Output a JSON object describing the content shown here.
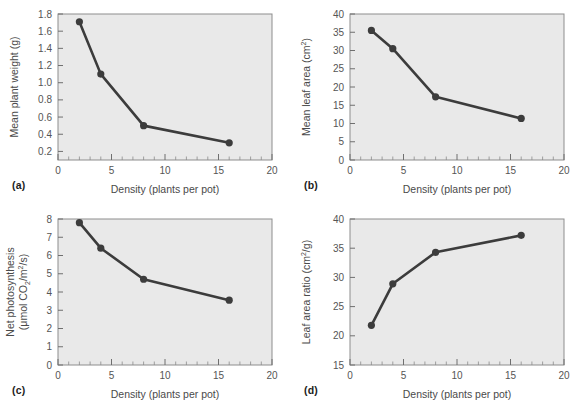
{
  "figure": {
    "background_color": "#ffffff",
    "plot_background_color": "#e9e9e9",
    "series_color": "#3c3c3c",
    "frame_color": "#8d8d8d",
    "shared_xlabel": "Density (plants per pot)"
  },
  "panels": [
    {
      "tag": "(a)",
      "ylabel": "Mean plant weight (g)",
      "ylabel_line1": "Mean plant weight (g)",
      "ytick_labels": [
        "0.2",
        "0.4",
        "0.6",
        "0.8",
        "1.0",
        "1.2",
        "1.4",
        "1.6",
        "1.8"
      ]
    },
    {
      "tag": "(b)",
      "ylabel": "Mean leaf area (cm2)",
      "ylabel_prefix": "Mean leaf area (cm",
      "ylabel_sup": "2",
      "ylabel_suffix": ")",
      "ytick_labels": [
        "0",
        "5",
        "10",
        "15",
        "20",
        "25",
        "30",
        "35",
        "40"
      ]
    },
    {
      "tag": "(c)",
      "ylabel": "Net photosynthesis (μmol CO2/m2/s)",
      "ylabel_line1": "Net photosynthesis",
      "ylabel_line2_a": "(μmol CO",
      "ylabel_line2_sub": "2",
      "ylabel_line2_b": "/m",
      "ylabel_line2_sup": "2",
      "ylabel_line2_c": "/s)",
      "ytick_labels": [
        "0",
        "1",
        "2",
        "3",
        "4",
        "5",
        "6",
        "7",
        "8"
      ]
    },
    {
      "tag": "(d)",
      "ylabel": "Leaf area ratio (cm2/g)",
      "ylabel_prefix": "Leaf area ratio (cm",
      "ylabel_sup": "2",
      "ylabel_suffix": "/g)",
      "ytick_labels": [
        "15",
        "20",
        "25",
        "30",
        "35",
        "40"
      ]
    }
  ],
  "xtick_labels": [
    "0",
    "5",
    "10",
    "15",
    "20"
  ],
  "chart_data": [
    {
      "type": "line",
      "panel": "(a)",
      "title": "",
      "xlabel": "Density (plants per pot)",
      "ylabel": "Mean plant weight (g)",
      "x": [
        2,
        4,
        8,
        16
      ],
      "values": [
        1.71,
        1.1,
        0.5,
        0.3
      ],
      "xlim": [
        0,
        20
      ],
      "ylim": [
        0.1,
        1.8
      ],
      "xticks": [
        0,
        5,
        10,
        15,
        20
      ],
      "yticks": [
        0.2,
        0.4,
        0.6,
        0.8,
        1.0,
        1.2,
        1.4,
        1.6,
        1.8
      ],
      "grid": false,
      "legend": "none",
      "marker": "filled-circle"
    },
    {
      "type": "line",
      "panel": "(b)",
      "title": "",
      "xlabel": "Density (plants per pot)",
      "ylabel": "Mean leaf area (cm2)",
      "x": [
        2,
        4,
        8,
        16
      ],
      "values": [
        35.5,
        30.5,
        17.3,
        11.4
      ],
      "xlim": [
        0,
        20
      ],
      "ylim": [
        0,
        40
      ],
      "xticks": [
        0,
        5,
        10,
        15,
        20
      ],
      "yticks": [
        0,
        5,
        10,
        15,
        20,
        25,
        30,
        35,
        40
      ],
      "grid": false,
      "legend": "none",
      "marker": "filled-circle"
    },
    {
      "type": "line",
      "panel": "(c)",
      "title": "",
      "xlabel": "Density (plants per pot)",
      "ylabel": "Net photosynthesis (μmol CO2/m2/s)",
      "x": [
        2,
        4,
        8,
        16
      ],
      "values": [
        7.8,
        6.4,
        4.7,
        3.55
      ],
      "xlim": [
        0,
        20
      ],
      "ylim": [
        0,
        8
      ],
      "xticks": [
        0,
        5,
        10,
        15,
        20
      ],
      "yticks": [
        0,
        1,
        2,
        3,
        4,
        5,
        6,
        7,
        8
      ],
      "grid": false,
      "legend": "none",
      "marker": "filled-circle"
    },
    {
      "type": "line",
      "panel": "(d)",
      "title": "",
      "xlabel": "Density (plants per pot)",
      "ylabel": "Leaf area ratio (cm2/g)",
      "x": [
        2,
        4,
        8,
        16
      ],
      "values": [
        21.8,
        28.9,
        34.3,
        37.2
      ],
      "xlim": [
        0,
        20
      ],
      "ylim": [
        15,
        40
      ],
      "xticks": [
        0,
        5,
        10,
        15,
        20
      ],
      "yticks": [
        15,
        20,
        25,
        30,
        35,
        40
      ],
      "grid": false,
      "legend": "none",
      "marker": "filled-circle"
    }
  ]
}
